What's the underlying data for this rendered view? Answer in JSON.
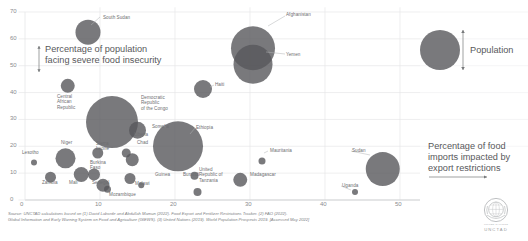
{
  "chart_data": {
    "type": "scatter",
    "title": "",
    "xlabel": "Percentage of food imports impacted by export restrictions",
    "ylabel": "Percentage of population facing severe food insecurity",
    "xlim": [
      -1,
      53
    ],
    "ylim": [
      -2,
      71
    ],
    "xticks": [
      0,
      10,
      20,
      30,
      40,
      50
    ],
    "yticks": [
      0,
      10,
      20,
      30,
      40,
      50,
      60,
      70
    ],
    "grid": true,
    "size_legend": "Population",
    "bubble_color": "#58585b",
    "points": [
      {
        "name": "South Sudan",
        "x": 8.4,
        "y": 62.5,
        "r": 12.5,
        "lx": 103,
        "ly": 15,
        "anchor": "left"
      },
      {
        "name": "Afghanistan",
        "x": 30.4,
        "y": 56.5,
        "r": 22.0,
        "lx": 286,
        "ly": 12,
        "anchor": "left"
      },
      {
        "name": "Yemen",
        "x": 30.4,
        "y": 50.5,
        "r": 19.5,
        "lx": 286,
        "ly": 52,
        "anchor": "left"
      },
      {
        "name": "Haiti",
        "x": 23.8,
        "y": 41.5,
        "x_px": 203,
        "y_px": 89,
        "r": 9.0,
        "lx": 215,
        "ly": 82,
        "anchor": "left"
      },
      {
        "name": "Central\nAfrican\nRepublic",
        "x": 5.7,
        "y": 42.5,
        "r": 7.0,
        "lx": 57,
        "ly": 94,
        "anchor": "left"
      },
      {
        "name": "Democratic\nRepublic\nof the Congo",
        "x": 11.6,
        "y": 29.0,
        "r": 26.0,
        "lx": 141,
        "ly": 95,
        "anchor": "left"
      },
      {
        "name": "Somalia",
        "x": 15.0,
        "y": 26.0,
        "r": 8.5,
        "lx": 152,
        "ly": 124,
        "anchor": "left"
      },
      {
        "name": "Ethiopia",
        "x": 20.4,
        "y": 20.0,
        "r": 25.0,
        "lx": 196,
        "ly": 125,
        "anchor": "left"
      },
      {
        "name": "Sierra\nLeone",
        "x": 9.7,
        "y": 17.5,
        "r": 5.5,
        "lx": 96,
        "ly": 141,
        "anchor": "left"
      },
      {
        "name": "Liberia",
        "x": 13.5,
        "y": 17.5,
        "r": 4.5,
        "lx": 134,
        "ly": 132,
        "anchor": "left"
      },
      {
        "name": "Chad",
        "x": 14.3,
        "y": 15.0,
        "r": 6.5,
        "lx": 137,
        "ly": 140,
        "anchor": "left"
      },
      {
        "name": "Niger",
        "x": 5.4,
        "y": 15.5,
        "r": 10.0,
        "lx": 61,
        "ly": 140,
        "anchor": "left"
      },
      {
        "name": "Lesotho",
        "x": 1.2,
        "y": 14.0,
        "r": 3.0,
        "lx": 22,
        "ly": 150,
        "anchor": "left"
      },
      {
        "name": "Mauritania",
        "x": 31.6,
        "y": 14.5,
        "r": 3.5,
        "lx": 270,
        "ly": 148,
        "anchor": "left"
      },
      {
        "name": "Sudan",
        "x": 47.7,
        "y": 11.5,
        "r": 17.0,
        "lx": 352,
        "ly": 148,
        "anchor": "left"
      },
      {
        "name": "Mali",
        "x": 7.5,
        "y": 9.5,
        "r": 7.5,
        "lx": 69,
        "ly": 180,
        "anchor": "left"
      },
      {
        "name": "Zambia",
        "x": 3.4,
        "y": 8.5,
        "r": 5.5,
        "lx": 42,
        "ly": 180,
        "anchor": "left"
      },
      {
        "name": "Burkina\nFaso",
        "x": 9.2,
        "y": 9.5,
        "r": 6.0,
        "lx": 90,
        "ly": 160,
        "anchor": "left"
      },
      {
        "name": "Senegal",
        "x": 10.4,
        "y": 5.5,
        "r": 6.5,
        "lx": 92,
        "ly": 180,
        "anchor": "left"
      },
      {
        "name": "Mozambique",
        "x": 11.0,
        "y": 4.0,
        "r": 3.5,
        "lx": 109,
        "ly": 192,
        "anchor": "left"
      },
      {
        "name": "Malawi",
        "x": 14.0,
        "y": 8.0,
        "r": 5.5,
        "lx": 135,
        "ly": 181,
        "anchor": "left"
      },
      {
        "name": "Guinea",
        "x": 15.5,
        "y": 5.5,
        "r": 3.0,
        "lx": 155,
        "ly": 172,
        "anchor": "left"
      },
      {
        "name": "Burundi",
        "x": 22.6,
        "y": 9.0,
        "r": 4.0,
        "lx": 183,
        "ly": 172,
        "anchor": "left"
      },
      {
        "name": "United\nRepublic of\nTanzania",
        "x": 23.0,
        "y": 3.0,
        "r": 4.0,
        "lx": 199,
        "ly": 167,
        "anchor": "left"
      },
      {
        "name": "Madagascar",
        "x": 28.7,
        "y": 7.5,
        "r": 7.0,
        "lx": 250,
        "ly": 172,
        "anchor": "left"
      },
      {
        "name": "Uganda",
        "x": 44.0,
        "y": 3.0,
        "r": 3.0,
        "lx": 342,
        "ly": 183,
        "anchor": "left"
      }
    ]
  },
  "annotations": {
    "y_axis_note": "Percentage of population\nfacing severe food insecurity",
    "x_axis_note": "Percentage of food\nimports impacted by\nexport restrictions",
    "population_legend": "Population"
  },
  "source": {
    "line1": "Source: UNCTAD calculations based on (1) David Laborde and Abdullah Mamun (2022). Food Export and Fertilizer Restrictions Tracker. (2) FAO (2022).",
    "line2": "Global Information and Early Warning System on Food and Agriculture (GIEWS). (3) United Nations (2019). World Population Prospects 2019. [Accessed May 2022]"
  },
  "logo": {
    "name": "UNCTAD",
    "subtitle": "UNITED NATIONS"
  },
  "colors": {
    "bubble": "#58585b",
    "grid": "#e6e7e8",
    "tick_text": "#8a8c8e",
    "label_text": "#6d6e71"
  }
}
